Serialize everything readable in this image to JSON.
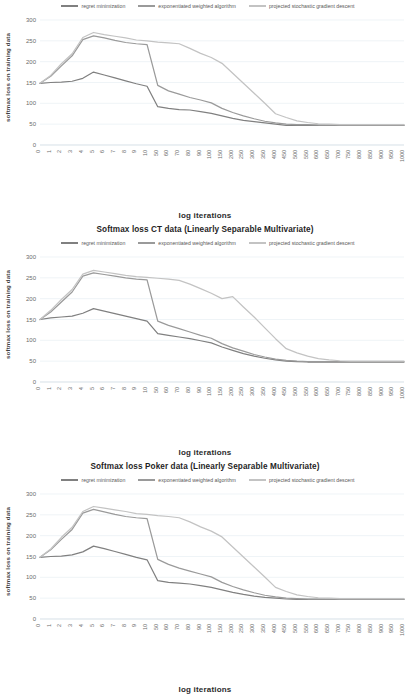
{
  "document": {
    "kind": "figure-sheet",
    "figure_count": 3
  },
  "legend": {
    "position": "top-center",
    "items": [
      {
        "label": "regret minimization",
        "color": "#808080"
      },
      {
        "label": "exponentiated weighted algorithm",
        "color": "#9a9a9a"
      },
      {
        "label": "projected stochastic gradient descent",
        "color": "#c3c3c3"
      }
    ]
  },
  "axes": {
    "xlabel": "log iterations",
    "ylabel": "softmax loss on training data",
    "yticks": [
      0,
      50,
      100,
      150,
      200,
      250,
      300
    ],
    "xticks": [
      "0",
      "1",
      "2",
      "3",
      "4",
      "5",
      "6",
      "7",
      "8",
      "9",
      "10",
      "50",
      "60",
      "70",
      "80",
      "90",
      "100",
      "150",
      "200",
      "250",
      "300",
      "350",
      "400",
      "450",
      "500",
      "550",
      "600",
      "650",
      "700",
      "750",
      "800",
      "850",
      "900",
      "950",
      "1000"
    ]
  },
  "figures": [
    {
      "index": 1,
      "title": ""
    },
    {
      "index": 2,
      "title": "Softmax loss CT data (Linearly Separable Multivariate)"
    },
    {
      "index": 3,
      "title": "Softmax loss Poker data (Linearly Separable Multivariate)"
    }
  ],
  "chart_data": [
    {
      "type": "line",
      "title": "",
      "xlabel": "log iterations",
      "ylabel": "softmax loss on training data",
      "ylim": [
        0,
        300
      ],
      "grid": true,
      "legend_position": "top-center",
      "categories": [
        "0",
        "1",
        "2",
        "3",
        "4",
        "5",
        "6",
        "7",
        "8",
        "9",
        "10",
        "50",
        "60",
        "70",
        "80",
        "90",
        "100",
        "150",
        "200",
        "250",
        "300",
        "350",
        "400",
        "450",
        "500",
        "550",
        "600",
        "650",
        "700",
        "750",
        "800",
        "850",
        "900",
        "950",
        "1000"
      ],
      "series": [
        {
          "name": "regret minimization",
          "color": "#808080",
          "values": [
            148,
            150,
            151,
            153,
            160,
            175,
            168,
            161,
            154,
            147,
            141,
            92,
            88,
            85,
            84,
            80,
            76,
            70,
            64,
            59,
            56,
            53,
            50,
            47,
            47,
            47,
            47,
            47,
            47,
            47,
            47,
            47,
            47,
            47,
            47
          ]
        },
        {
          "name": "exponentiated weighted algorithm",
          "color": "#9a9a9a",
          "values": [
            148,
            165,
            190,
            214,
            253,
            262,
            257,
            251,
            246,
            243,
            241,
            143,
            130,
            122,
            114,
            108,
            101,
            88,
            78,
            70,
            63,
            57,
            53,
            50,
            49,
            49,
            48,
            48,
            48,
            48,
            48,
            48,
            48,
            48,
            48
          ]
        },
        {
          "name": "projected stochastic gradient descent",
          "color": "#c3c3c3",
          "values": [
            148,
            167,
            195,
            219,
            258,
            270,
            265,
            261,
            257,
            252,
            250,
            247,
            245,
            243,
            232,
            220,
            210,
            196,
            172,
            148,
            124,
            100,
            75,
            66,
            58,
            54,
            51,
            50,
            49,
            49,
            49,
            49,
            49,
            49,
            49
          ]
        }
      ]
    },
    {
      "type": "line",
      "title": "Softmax loss CT data (Linearly Separable Multivariate)",
      "xlabel": "log iterations",
      "ylabel": "softmax loss on training data",
      "ylim": [
        0,
        300
      ],
      "grid": true,
      "legend_position": "top-center",
      "categories": [
        "0",
        "1",
        "2",
        "3",
        "4",
        "5",
        "6",
        "7",
        "8",
        "9",
        "10",
        "50",
        "60",
        "70",
        "80",
        "90",
        "100",
        "150",
        "200",
        "250",
        "300",
        "350",
        "400",
        "450",
        "500",
        "550",
        "600",
        "650",
        "700",
        "750",
        "800",
        "850",
        "900",
        "950",
        "1000"
      ],
      "series": [
        {
          "name": "regret minimization",
          "color": "#808080",
          "values": [
            150,
            154,
            156,
            158,
            165,
            176,
            170,
            164,
            158,
            152,
            146,
            116,
            112,
            108,
            104,
            99,
            94,
            84,
            76,
            68,
            62,
            57,
            53,
            50,
            49,
            48,
            48,
            48,
            48,
            48,
            48,
            48,
            48,
            48,
            48
          ]
        },
        {
          "name": "exponentiated weighted algorithm",
          "color": "#9a9a9a",
          "values": [
            150,
            168,
            192,
            216,
            254,
            262,
            258,
            254,
            250,
            247,
            245,
            146,
            136,
            128,
            120,
            112,
            105,
            92,
            82,
            74,
            66,
            60,
            55,
            52,
            50,
            49,
            49,
            49,
            49,
            49,
            49,
            49,
            49,
            49,
            49
          ]
        },
        {
          "name": "projected stochastic gradient descent",
          "color": "#c3c3c3",
          "values": [
            150,
            172,
            198,
            222,
            259,
            268,
            264,
            260,
            256,
            253,
            251,
            249,
            247,
            244,
            235,
            224,
            213,
            200,
            205,
            180,
            156,
            130,
            104,
            80,
            70,
            62,
            56,
            53,
            51,
            50,
            50,
            50,
            50,
            50,
            50
          ]
        }
      ]
    },
    {
      "type": "line",
      "title": "Softmax loss Poker data (Linearly Separable Multivariate)",
      "xlabel": "log iterations",
      "ylabel": "softmax loss on training data",
      "ylim": [
        0,
        300
      ],
      "grid": true,
      "legend_position": "top-center",
      "categories": [
        "0",
        "1",
        "2",
        "3",
        "4",
        "5",
        "6",
        "7",
        "8",
        "9",
        "10",
        "50",
        "60",
        "70",
        "80",
        "90",
        "100",
        "150",
        "200",
        "250",
        "300",
        "350",
        "400",
        "450",
        "500",
        "550",
        "600",
        "650",
        "700",
        "750",
        "800",
        "850",
        "900",
        "950",
        "1000"
      ],
      "series": [
        {
          "name": "regret minimization",
          "color": "#808080",
          "values": [
            148,
            150,
            151,
            154,
            161,
            175,
            169,
            162,
            155,
            148,
            142,
            92,
            88,
            86,
            84,
            80,
            76,
            70,
            64,
            59,
            55,
            52,
            50,
            48,
            47,
            47,
            47,
            47,
            47,
            47,
            47,
            47,
            47,
            47,
            47
          ]
        },
        {
          "name": "exponentiated weighted algorithm",
          "color": "#9a9a9a",
          "values": [
            148,
            166,
            191,
            215,
            254,
            263,
            257,
            251,
            246,
            243,
            241,
            143,
            131,
            122,
            115,
            108,
            101,
            88,
            78,
            70,
            63,
            57,
            53,
            50,
            49,
            48,
            48,
            48,
            48,
            48,
            48,
            48,
            48,
            48,
            48
          ]
        },
        {
          "name": "projected stochastic gradient descent",
          "color": "#c3c3c3",
          "values": [
            148,
            168,
            196,
            220,
            258,
            270,
            266,
            262,
            258,
            253,
            251,
            248,
            246,
            243,
            233,
            221,
            211,
            197,
            173,
            149,
            125,
            101,
            76,
            66,
            58,
            54,
            51,
            50,
            49,
            49,
            49,
            49,
            49,
            49,
            49
          ]
        }
      ]
    }
  ]
}
